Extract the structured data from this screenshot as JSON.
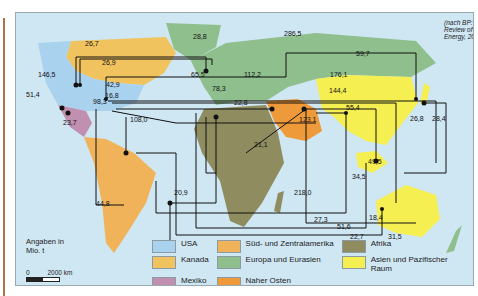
{
  "source_note": "(nach BP: Statistical Review of World Energy, 2013)",
  "unit_note": "Angaben in Mio. t",
  "scale": {
    "zero": "0",
    "label": "2000 km"
  },
  "legend": [
    {
      "label": "USA",
      "color": "#a9d2ef"
    },
    {
      "label": "Kanada",
      "color": "#f1c35e"
    },
    {
      "label": "Mexiko",
      "color": "#c18fb0"
    },
    {
      "label": "Süd- und Zentralamerika",
      "color": "#f0b35a"
    },
    {
      "label": "Europa und Eurasien",
      "color": "#8fbf8d"
    },
    {
      "label": "Naher Osten",
      "color": "#ef9a3a"
    },
    {
      "label": "Afrika",
      "color": "#8f8c60"
    },
    {
      "label": "Asien und Pazifischer Raum",
      "color": "#f6ef52"
    }
  ],
  "flows": [
    {
      "value": "28,8",
      "x": 177,
      "y": 35
    },
    {
      "value": "286,5",
      "x": 285,
      "y": 32
    },
    {
      "value": "26,7",
      "x": 84,
      "y": 42
    },
    {
      "value": "59,7",
      "x": 350,
      "y": 52
    },
    {
      "value": "26,9",
      "x": 100,
      "y": 61
    },
    {
      "value": "146,5",
      "x": 43,
      "y": 73
    },
    {
      "value": "65,5",
      "x": 190,
      "y": 73
    },
    {
      "value": "112,2",
      "x": 241,
      "y": 73
    },
    {
      "value": "176,1",
      "x": 329,
      "y": 73
    },
    {
      "value": "42,9",
      "x": 104,
      "y": 83
    },
    {
      "value": "78,3",
      "x": 210,
      "y": 87
    },
    {
      "value": "144,4",
      "x": 327,
      "y": 89
    },
    {
      "value": "16,8",
      "x": 102,
      "y": 94
    },
    {
      "value": "51,4",
      "x": 50,
      "y": 93
    },
    {
      "value": "98,3",
      "x": 92,
      "y": 102
    },
    {
      "value": "22,8",
      "x": 232,
      "y": 100
    },
    {
      "value": "55,4",
      "x": 346,
      "y": 106
    },
    {
      "value": "23,7",
      "x": 60,
      "y": 113
    },
    {
      "value": "108,0",
      "x": 128,
      "y": 117
    },
    {
      "value": "123,1",
      "x": 296,
      "y": 118
    },
    {
      "value": "21,1",
      "x": 252,
      "y": 132
    },
    {
      "value": "26,8",
      "x": 392,
      "y": 115
    },
    {
      "value": "28,4",
      "x": 412,
      "y": 115
    },
    {
      "value": "49,5",
      "x": 366,
      "y": 148
    },
    {
      "value": "34,5",
      "x": 346,
      "y": 163
    },
    {
      "value": "20,9",
      "x": 171,
      "y": 178
    },
    {
      "value": "44,8",
      "x": 95,
      "y": 190
    },
    {
      "value": "218,0",
      "x": 295,
      "y": 180
    },
    {
      "value": "27,3",
      "x": 314,
      "y": 206
    },
    {
      "value": "51,6",
      "x": 336,
      "y": 212
    },
    {
      "value": "18,4",
      "x": 365,
      "y": 212
    },
    {
      "value": "22,7",
      "x": 352,
      "y": 222
    },
    {
      "value": "31,5",
      "x": 385,
      "y": 222
    }
  ]
}
